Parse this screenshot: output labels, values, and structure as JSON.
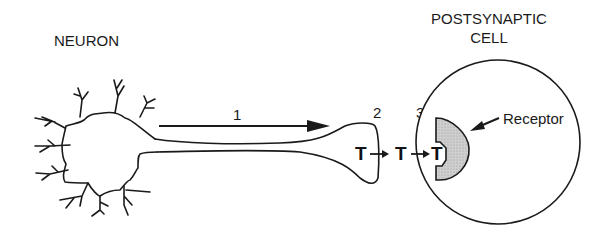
{
  "labels": {
    "neuron": "NEURON",
    "postsynaptic_line1": "POSTSYNAPTIC",
    "postsynaptic_line2": "CELL",
    "receptor": "Receptor",
    "step1": "1",
    "step2": "2",
    "step3": "3",
    "transmitter1": "T",
    "transmitter2": "T",
    "transmitter3": "T"
  },
  "colors": {
    "line": "#1a1a1a",
    "receptor_fill": "#c8c8c8",
    "background": "#ffffff"
  }
}
